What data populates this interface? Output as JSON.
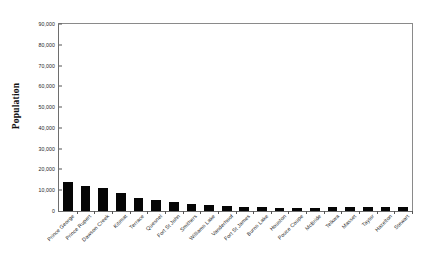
{
  "chart_data": {
    "type": "bar",
    "title": "",
    "xlabel": "",
    "ylabel": "Population",
    "ylim": [
      0,
      90000
    ],
    "ytick_step": 10000,
    "grid": false,
    "legend": "none",
    "bar_color": "#050505",
    "axis_color": "#6e6e6e",
    "ytick_labels": [
      "0",
      "10,000",
      "20,000",
      "30,000",
      "40,000",
      "50,000",
      "60,000",
      "70,000",
      "80,000",
      "90,000"
    ],
    "ytick_values": [
      0,
      10000,
      20000,
      30000,
      40000,
      50000,
      60000,
      70000,
      80000,
      90000
    ],
    "categories": [
      "Prince George",
      "Prince Rupert",
      "Dawson Creek",
      "Kitimat",
      "Terrace",
      "Quesnel",
      "Fort St John",
      "Smithers",
      "Williams Lake",
      "Vanderhoof",
      "Fort St James",
      "Burns Lake",
      "Houston",
      "Pouce Coupe",
      "McBride",
      "Telkwa",
      "Masset",
      "Taylor",
      "Hazelton",
      "Stewart"
    ],
    "values": [
      14000,
      12200,
      11200,
      8600,
      6400,
      5300,
      4400,
      3300,
      2900,
      2400,
      1700,
      2100,
      1600,
      1500,
      1600,
      1800,
      1900,
      1800,
      1900,
      1700
    ]
  }
}
